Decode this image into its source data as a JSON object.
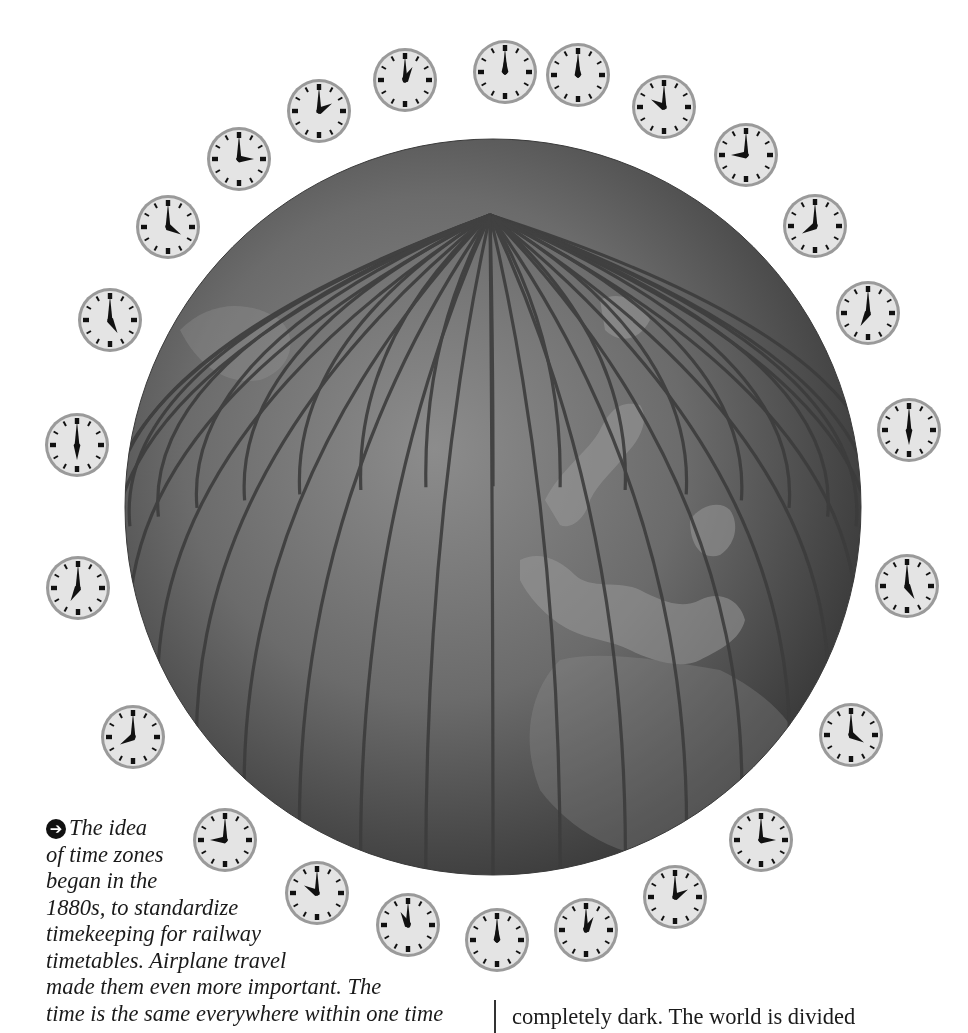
{
  "figure": {
    "globe": {
      "cx": 493,
      "cy": 507,
      "r": 368,
      "meridian_count": 36,
      "color_dark": "#3a3a3a",
      "color_light": "#8a8a8a"
    },
    "clocks": [
      {
        "label": "12:00",
        "x": 505,
        "y": 72,
        "hour": 12,
        "minute": 0
      },
      {
        "label": "11:00",
        "x": 578,
        "y": 75,
        "hour": 11.9,
        "minute": 0
      },
      {
        "label": "10:00",
        "x": 664,
        "y": 107,
        "hour": 10,
        "minute": 0
      },
      {
        "label": "9:00",
        "x": 746,
        "y": 155,
        "hour": 9,
        "minute": 0
      },
      {
        "label": "8:00",
        "x": 815,
        "y": 226,
        "hour": 8,
        "minute": 0
      },
      {
        "label": "7:00",
        "x": 868,
        "y": 313,
        "hour": 7,
        "minute": 0
      },
      {
        "label": "6:00",
        "x": 909,
        "y": 430,
        "hour": 6,
        "minute": 0
      },
      {
        "label": "5:00",
        "x": 907,
        "y": 586,
        "hour": 5,
        "minute": 0
      },
      {
        "label": "4:00",
        "x": 851,
        "y": 735,
        "hour": 4,
        "minute": 0
      },
      {
        "label": "3:00",
        "x": 761,
        "y": 840,
        "hour": 3,
        "minute": 0
      },
      {
        "label": "2:00",
        "x": 675,
        "y": 897,
        "hour": 2,
        "minute": 0
      },
      {
        "label": "1:00",
        "x": 586,
        "y": 930,
        "hour": 1,
        "minute": 0
      },
      {
        "label": "12:00",
        "x": 497,
        "y": 940,
        "hour": 12,
        "minute": 0
      },
      {
        "label": "11:00",
        "x": 408,
        "y": 925,
        "hour": 11,
        "minute": 0
      },
      {
        "label": "10:00",
        "x": 317,
        "y": 893,
        "hour": 10,
        "minute": 0
      },
      {
        "label": "9:00",
        "x": 225,
        "y": 840,
        "hour": 9,
        "minute": 0
      },
      {
        "label": "8:00",
        "x": 133,
        "y": 737,
        "hour": 8,
        "minute": 0
      },
      {
        "label": "7:00",
        "x": 78,
        "y": 588,
        "hour": 7,
        "minute": 0
      },
      {
        "label": "6:00",
        "x": 77,
        "y": 445,
        "hour": 6,
        "minute": 0
      },
      {
        "label": "5:00",
        "x": 110,
        "y": 320,
        "hour": 5,
        "minute": 0
      },
      {
        "label": "4:00",
        "x": 168,
        "y": 227,
        "hour": 4,
        "minute": 0
      },
      {
        "label": "3:00",
        "x": 239,
        "y": 159,
        "hour": 3,
        "minute": 0
      },
      {
        "label": "2:00",
        "x": 319,
        "y": 111,
        "hour": 2,
        "minute": 0
      },
      {
        "label": "1:00",
        "x": 405,
        "y": 80,
        "hour": 1,
        "minute": 0
      }
    ],
    "clock_colors": {
      "face": "#e4e4e4",
      "rim": "#9a9a9a",
      "ink": "#111111"
    }
  },
  "caption": {
    "bullet_icon": "➔",
    "lines": [
      "The idea",
      "of time zones",
      "began in the",
      "1880s, to standardize",
      "timekeeping for railway",
      "timetables. Airplane travel",
      "made them even more important. The",
      "time is the same everywhere within one time"
    ]
  },
  "body_column": {
    "text": "completely dark. The world is divided"
  }
}
